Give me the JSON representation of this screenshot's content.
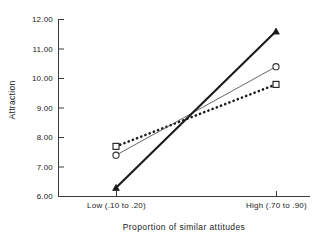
{
  "chart_data": {
    "type": "line",
    "title": "",
    "xlabel": "Proportion of similar attitudes",
    "ylabel": "Attraction",
    "categories": [
      "Low (.10 to .20)",
      "High (.70 to .90)"
    ],
    "x": [
      0,
      1
    ],
    "xlim": [
      -0.36,
      1.21
    ],
    "ylim": [
      6.0,
      12.0
    ],
    "yticks": [
      "6.00",
      "7.00",
      "8.00",
      "9.00",
      "10.00",
      "11.00",
      "12.00"
    ],
    "ytick_values": [
      6.0,
      7.0,
      8.0,
      9.0,
      10.0,
      11.0,
      12.0
    ],
    "grid": false,
    "legend": "none",
    "series": [
      {
        "name": "triangle-series",
        "marker": "triangle",
        "line_style": "solid-thick",
        "color": "#1a1a1a",
        "values": [
          6.3,
          11.6
        ]
      },
      {
        "name": "circle-series",
        "marker": "circle",
        "line_style": "solid-thin",
        "color": "#4d4d4d",
        "values": [
          7.4,
          10.4
        ]
      },
      {
        "name": "square-series",
        "marker": "square",
        "line_style": "dotted-thick",
        "color": "#1a1a1a",
        "values": [
          7.7,
          9.8
        ]
      }
    ]
  },
  "axes": {
    "y_tick_labels": [
      "12.00",
      "11.00",
      "10.00",
      "9.00",
      "8.00",
      "7.00",
      "6.00"
    ],
    "x_tick_labels": [
      "Low (.10 to .20)",
      "High (.70 to .90)"
    ],
    "y_axis_title": "Attraction",
    "x_axis_title": "Proportion of similar attitudes"
  }
}
